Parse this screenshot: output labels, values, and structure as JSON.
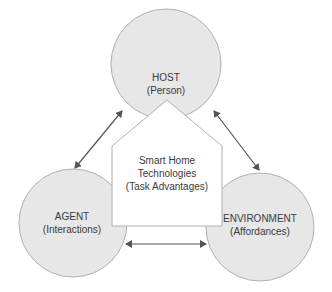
{
  "diagram": {
    "colors": {
      "circle_fill": "#e7e7e7",
      "circle_stroke": "#b0b0b0",
      "pentagon_fill": "#ffffff",
      "pentagon_stroke": "#b0b0b0",
      "arrow": "#555555",
      "text": "#3a3a3a"
    },
    "nodes": {
      "host": {
        "title": "HOST",
        "subtitle": "(Person)"
      },
      "agent": {
        "title": "AGENT",
        "subtitle": "(Interactions)"
      },
      "environment": {
        "title": "ENVIRONMENT",
        "subtitle": "(Affordances)"
      },
      "center": {
        "line1": "Smart Home",
        "line2": "Technologies",
        "line3": "(Task Advantages)"
      }
    },
    "edges": [
      {
        "from": "host",
        "to": "agent",
        "type": "bidirectional"
      },
      {
        "from": "host",
        "to": "environment",
        "type": "bidirectional"
      },
      {
        "from": "agent",
        "to": "environment",
        "type": "bidirectional"
      }
    ]
  }
}
